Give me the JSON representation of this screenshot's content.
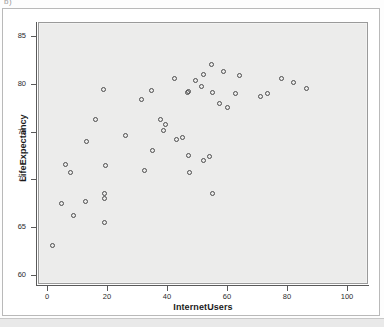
{
  "figure": {
    "label": "b)"
  },
  "chart_data": {
    "type": "scatter",
    "title": "",
    "xlabel": "InternetUsers",
    "ylabel": "LifeExpectancy",
    "xlim": [
      -3,
      107
    ],
    "ylim": [
      59,
      86.5
    ],
    "xticks": [
      0,
      20,
      40,
      60,
      80,
      100
    ],
    "yticks": [
      60,
      65,
      70,
      75,
      80,
      85
    ],
    "grid": false,
    "legend": null,
    "marker": "open-circle",
    "marker_color": "#4d4d4d",
    "panel_color": "#ececeb",
    "series": [
      {
        "name": "Countries",
        "points": [
          [
            1.8,
            63.0
          ],
          [
            4.8,
            67.5
          ],
          [
            6.3,
            71.6
          ],
          [
            7.7,
            70.7
          ],
          [
            8.7,
            66.2
          ],
          [
            12.8,
            67.7
          ],
          [
            13.2,
            74.0
          ],
          [
            16.3,
            76.3
          ],
          [
            18.8,
            79.4
          ],
          [
            19.0,
            68.5
          ],
          [
            19.0,
            68.0
          ],
          [
            19.3,
            65.5
          ],
          [
            19.6,
            71.4
          ],
          [
            26.0,
            74.6
          ],
          [
            31.5,
            78.4
          ],
          [
            32.4,
            70.9
          ],
          [
            34.8,
            79.3
          ],
          [
            35.0,
            73.0
          ],
          [
            37.8,
            76.3
          ],
          [
            38.7,
            75.1
          ],
          [
            39.6,
            75.7
          ],
          [
            42.4,
            80.6
          ],
          [
            43.0,
            74.2
          ],
          [
            45.1,
            74.4
          ],
          [
            46.8,
            79.1
          ],
          [
            47.0,
            79.2
          ],
          [
            47.3,
            72.5
          ],
          [
            47.6,
            70.7
          ],
          [
            49.5,
            80.4
          ],
          [
            51.6,
            79.7
          ],
          [
            52.0,
            81.0
          ],
          [
            52.3,
            72.0
          ],
          [
            54.2,
            72.4
          ],
          [
            54.7,
            82.0
          ],
          [
            55.0,
            68.5
          ],
          [
            55.3,
            79.1
          ],
          [
            57.5,
            78.0
          ],
          [
            58.8,
            81.3
          ],
          [
            60.3,
            77.5
          ],
          [
            62.9,
            79.0
          ],
          [
            64.0,
            80.9
          ],
          [
            71.2,
            78.7
          ],
          [
            73.4,
            79.0
          ],
          [
            78.0,
            80.6
          ],
          [
            82.2,
            80.2
          ],
          [
            86.5,
            79.5
          ]
        ]
      }
    ]
  }
}
